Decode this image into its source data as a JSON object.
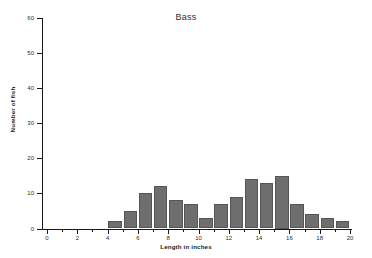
{
  "chart_data": {
    "type": "bar",
    "title": "Bass",
    "xlabel": "Length in inches",
    "ylabel": "Number of fish",
    "xlim": [
      0,
      20
    ],
    "ylim": [
      0,
      60
    ],
    "grid": false,
    "legend": null,
    "bin_width": 1,
    "bar_color": "#6e6e6e",
    "bar_edge_color": "#555555",
    "axis_color": "#1a1a1a",
    "categories": [
      "4",
      "5",
      "6",
      "7",
      "8",
      "9",
      "10",
      "11",
      "12",
      "13",
      "14",
      "15",
      "16",
      "17",
      "18",
      "19"
    ],
    "bins": [
      {
        "start": 4,
        "end": 5,
        "count": 2
      },
      {
        "start": 5,
        "end": 6,
        "count": 5
      },
      {
        "start": 6,
        "end": 7,
        "count": 10
      },
      {
        "start": 7,
        "end": 8,
        "count": 12
      },
      {
        "start": 8,
        "end": 9,
        "count": 8
      },
      {
        "start": 9,
        "end": 10,
        "count": 7
      },
      {
        "start": 10,
        "end": 11,
        "count": 3
      },
      {
        "start": 11,
        "end": 12,
        "count": 7
      },
      {
        "start": 12,
        "end": 13,
        "count": 9
      },
      {
        "start": 13,
        "end": 14,
        "count": 14
      },
      {
        "start": 14,
        "end": 15,
        "count": 13
      },
      {
        "start": 15,
        "end": 16,
        "count": 15
      },
      {
        "start": 16,
        "end": 17,
        "count": 7
      },
      {
        "start": 17,
        "end": 18,
        "count": 4
      },
      {
        "start": 18,
        "end": 19,
        "count": 3
      },
      {
        "start": 19,
        "end": 20,
        "count": 2
      }
    ],
    "values": [
      2,
      5,
      10,
      12,
      8,
      7,
      3,
      7,
      9,
      14,
      13,
      15,
      7,
      4,
      3,
      2
    ],
    "yticks": [
      0,
      10,
      20,
      30,
      40,
      50,
      60
    ],
    "ytick_labels": [
      "0",
      "10",
      "20",
      "30",
      "40",
      "50",
      "60"
    ],
    "xticks_major": [
      0,
      2,
      4,
      6,
      8,
      10,
      12,
      14,
      16,
      18,
      20
    ],
    "xtick_labels": [
      "0",
      "2",
      "4",
      "6",
      "8",
      "10",
      "12",
      "14",
      "16",
      "18",
      "20"
    ],
    "xticks_minor": [
      1,
      3,
      5,
      7,
      9,
      11,
      13,
      15,
      17,
      19
    ]
  }
}
